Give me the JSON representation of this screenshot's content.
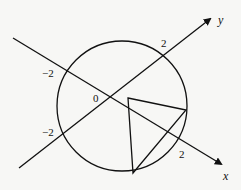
{
  "diagram": {
    "axes": {
      "x_label": "x",
      "y_label": "y",
      "origin_label": "0"
    },
    "ticks": {
      "y_pos": "2",
      "x_neg": "−2",
      "y_neg": "−2",
      "x_pos": "2"
    },
    "shapes": {
      "circle": {
        "center": "origin",
        "radius": 2
      },
      "triangle": {
        "vertices": 3,
        "inscribed": "two vertices on circle, one inside"
      }
    },
    "colors": {
      "stroke": "#111111",
      "background": "#f7f7f5"
    }
  }
}
